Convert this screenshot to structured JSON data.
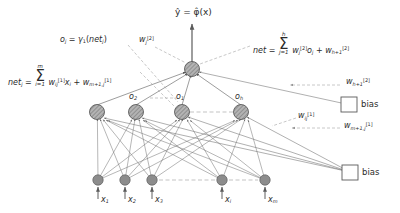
{
  "diagram": {
    "title_equations": {
      "output_expr": "ŷ = φ̂(x)",
      "hidden_activation": "o",
      "hidden_activation_sub": "j",
      "hidden_activation_rhs_fn": "γ",
      "hidden_activation_rhs_fn_sub": "1",
      "hidden_activation_rhs_arg": "net",
      "hidden_activation_rhs_arg_sub": "j",
      "net_j_lhs": "net",
      "net_j_lhs_sub": "j",
      "net_j_sum_top": "m",
      "net_j_sum_bot": "i=1",
      "net_j_w": "w",
      "net_j_w_sub": "ij",
      "net_j_w_sup": "[1]",
      "net_j_x": "x",
      "net_j_x_sub": "i",
      "net_j_bias_w": "w",
      "net_j_bias_sub": "m+1,j",
      "net_j_bias_sup": "[1]",
      "net_lhs": "net",
      "net_sum_top": "h",
      "net_sum_bot": "j=1",
      "net_w": "w",
      "net_w_sub": "j",
      "net_w_sup": "[2]",
      "net_o": "o",
      "net_o_sub": "j",
      "net_bias_w": "w",
      "net_bias_sub": "h+1",
      "net_bias_sup": "[2]"
    },
    "weight_labels": [
      {
        "name": "w-j-2",
        "base": "w",
        "sub": "j",
        "sup": "[2]"
      },
      {
        "name": "w-h1-2",
        "base": "w",
        "sub": "h+1",
        "sup": "[2]"
      },
      {
        "name": "w-ij-1",
        "base": "w",
        "sub": "ij",
        "sup": "[1]"
      },
      {
        "name": "w-m1j-1",
        "base": "w",
        "sub": "m+1,j",
        "sup": "[1]"
      }
    ],
    "hidden_nodes": [
      {
        "label": "",
        "sub": ""
      },
      {
        "label": "o",
        "sub": "2"
      },
      {
        "label": "o",
        "sub": "1"
      },
      {
        "label": "o",
        "sub": "h"
      }
    ],
    "input_labels": [
      {
        "base": "x",
        "sub": "1"
      },
      {
        "base": "x",
        "sub": "2"
      },
      {
        "base": "x",
        "sub": "3"
      },
      {
        "base": "x",
        "sub": "i"
      },
      {
        "base": "x",
        "sub": "m"
      }
    ],
    "bias_boxes": [
      {
        "name": "bias-output-layer",
        "label": "bias"
      },
      {
        "name": "bias-hidden-layer",
        "label": "bias"
      }
    ],
    "colors": {
      "node_fill": "#8c8c8c",
      "node_stroke": "#4d4d4d",
      "line": "#6e6e6e",
      "dashed": "#8a8a8a",
      "text": "#2b2b2b",
      "background": "#ffffff"
    }
  }
}
